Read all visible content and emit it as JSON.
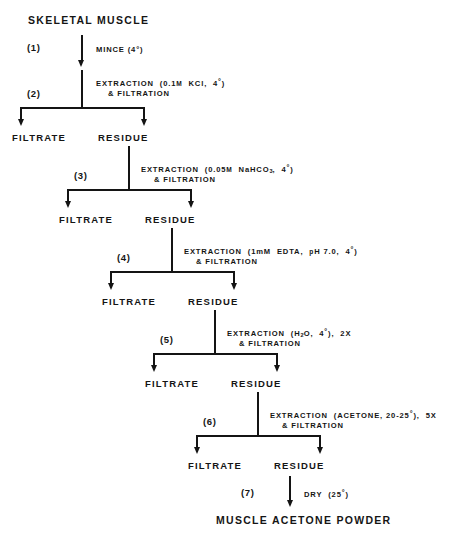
{
  "diagram": {
    "start_node": "SKELETAL MUSCLE",
    "end_node": "MUSCLE ACETONE POWDER",
    "filtrate_label": "FILTRATE",
    "residue_label": "RESIDUE",
    "steps": [
      {
        "number": "(1)",
        "operation_line1": "MINCE  (4°)",
        "operation_line2": "",
        "outputs": []
      },
      {
        "number": "(2)",
        "operation_line1": "EXTRACTION  (0.1M  KCl,  4°)",
        "operation_line2": "& FILTRATION",
        "outputs": [
          "FILTRATE",
          "RESIDUE"
        ]
      },
      {
        "number": "(3)",
        "operation_line1": "EXTRACTION  (0.05M  NaHCO3,  4°)",
        "operation_line2": "& FILTRATION",
        "outputs": [
          "FILTRATE",
          "RESIDUE"
        ]
      },
      {
        "number": "(4)",
        "operation_line1": "EXTRACTION  (1mM  EDTA,  pH 7.0,  4°)",
        "operation_line2": "& FILTRATION",
        "outputs": [
          "FILTRATE",
          "RESIDUE"
        ]
      },
      {
        "number": "(5)",
        "operation_line1": "EXTRACTION  (H2O,  4°),  2X",
        "operation_line2": "& FILTRATION",
        "outputs": [
          "FILTRATE",
          "RESIDUE"
        ]
      },
      {
        "number": "(6)",
        "operation_line1": "EXTRACTION  (ACETONE, 20-25°),  5X",
        "operation_line2": "& FILTRATION",
        "outputs": [
          "FILTRATE",
          "RESIDUE"
        ]
      },
      {
        "number": "(7)",
        "operation_line1": "DRY  (25°)",
        "operation_line2": "",
        "outputs": [
          "MUSCLE ACETONE POWDER"
        ]
      }
    ],
    "colors": {
      "ink": "#141414",
      "background": "#ffffff"
    }
  }
}
